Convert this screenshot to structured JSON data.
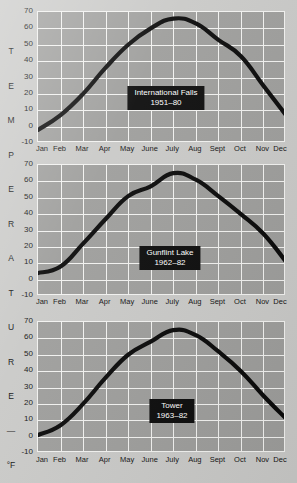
{
  "figure": {
    "background_color": "#c9c9c7",
    "plot_background_color": "#9d9d9b",
    "grid_color": "#f2f2f0",
    "line_color": "#080808",
    "callout_bg_color": "#0b0b0b",
    "callout_text_color": "#ffffff",
    "vertical_caption_letters": [
      "T",
      "E",
      "M",
      "P",
      "E",
      "R",
      "A",
      "T",
      "U",
      "R",
      "E",
      "—",
      "°F"
    ]
  },
  "axis": {
    "y_ticks": [
      "70",
      "60",
      "50",
      "40",
      "30",
      "20",
      "10",
      "0",
      "-10"
    ],
    "y_values": [
      70,
      60,
      50,
      40,
      30,
      20,
      10,
      0,
      -10
    ],
    "y_min": -10,
    "y_max": 70,
    "x_ticks": [
      "Jan",
      "Feb",
      "Mar",
      "Apr",
      "May",
      "June",
      "July",
      "Aug",
      "Sept",
      "Oct",
      "Nov",
      "Dec"
    ]
  },
  "chart_data": [
    {
      "type": "line",
      "title": "International Falls",
      "subtitle": "1951–80",
      "xlabel": "",
      "ylabel": "TEMPERATURE — °F",
      "categories": [
        "Jan",
        "Feb",
        "Mar",
        "Apr",
        "May",
        "June",
        "July",
        "Aug",
        "Sept",
        "Oct",
        "Nov",
        "Dec"
      ],
      "values": [
        -2,
        7,
        20,
        36,
        50,
        60,
        66,
        63,
        53,
        43,
        25,
        7
      ],
      "ylim": [
        -10,
        70
      ],
      "grid": true,
      "legend": "none"
    },
    {
      "type": "line",
      "title": "Gunflint Lake",
      "subtitle": "1962–82",
      "xlabel": "",
      "ylabel": "TEMPERATURE — °F",
      "categories": [
        "Jan",
        "Feb",
        "Mar",
        "Apr",
        "May",
        "June",
        "July",
        "Aug",
        "Sept",
        "Oct",
        "Nov",
        "Dec"
      ],
      "values": [
        4,
        8,
        22,
        37,
        51,
        57,
        65,
        61,
        51,
        40,
        28,
        11
      ],
      "ylim": [
        -10,
        70
      ],
      "grid": true,
      "legend": "none"
    },
    {
      "type": "line",
      "title": "Tower",
      "subtitle": "1963–82",
      "xlabel": "",
      "ylabel": "TEMPERATURE — °F",
      "categories": [
        "Jan",
        "Feb",
        "Mar",
        "Apr",
        "May",
        "June",
        "July",
        "Aug",
        "Sept",
        "Oct",
        "Nov",
        "Dec"
      ],
      "values": [
        1,
        7,
        20,
        36,
        50,
        58,
        65,
        62,
        52,
        40,
        25,
        11
      ],
      "ylim": [
        -10,
        70
      ],
      "grid": true,
      "legend": "none"
    }
  ],
  "panels": [
    {
      "top": 10,
      "plot_top": 11,
      "plot_height": 131,
      "xlabels_top": 144,
      "callout_cx": 166,
      "callout_cy": 86
    },
    {
      "top": 163,
      "plot_top": 164,
      "plot_height": 131,
      "xlabels_top": 297,
      "callout_cx": 170,
      "callout_cy": 246
    },
    {
      "top": 320,
      "plot_top": 321,
      "plot_height": 131,
      "xlabels_top": 455,
      "callout_cx": 172,
      "callout_cy": 399
    }
  ]
}
